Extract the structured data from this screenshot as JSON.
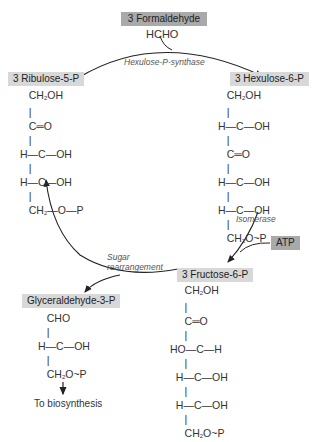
{
  "nodes": {
    "formaldehyde": {
      "label": "3 Formaldehyde",
      "formula": "HCHO"
    },
    "ribulose": {
      "label": "3 Ribulose-5-P",
      "structure": [
        "CH₂OH",
        "|",
        "C—O",
        "|",
        "H—C—OH",
        "|",
        "H—C—OH",
        "|",
        "CH₂—O—P"
      ]
    },
    "hexulose": {
      "label": "3 Hexulose-6-P",
      "structure": [
        "CH₂OH",
        "|",
        "H—C—OH",
        "|",
        "C═O",
        "|",
        "H—C—OH",
        "|",
        "H—C—OH",
        "|",
        "CH₂O~P"
      ]
    },
    "fructose": {
      "label": "3 Fructose-6-P",
      "structure": [
        "CH₂OH",
        "|",
        "C═O",
        "|",
        "HO—C—H",
        "|",
        "H—C—OH",
        "|",
        "H—C—OH",
        "|",
        "CH₂O~P"
      ]
    },
    "glyceraldehyde": {
      "label": "Glyceraldehyde-3-P",
      "structure": [
        "CHO",
        "|",
        "H—C—OH",
        "|",
        "CH₂O~P"
      ]
    },
    "atp": {
      "label": "ATP"
    }
  },
  "enzymes": {
    "synthase": "Hexulose-P-synthase",
    "isomerase": "Isomerase",
    "rearrangement_1": "Sugar",
    "rearrangement_2": "rearrangement"
  },
  "output": {
    "label": "To biosynthesis"
  },
  "colors": {
    "box_light": "#d8d8d8",
    "box_dark": "#a9a9a9",
    "line": "#222222"
  }
}
